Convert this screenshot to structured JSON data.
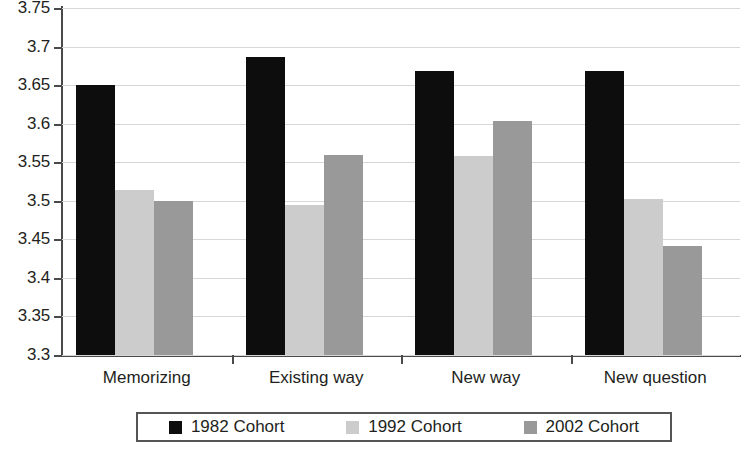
{
  "chart_data": {
    "type": "bar",
    "title": "",
    "subtitle": "",
    "xlabel": "",
    "ylabel": "",
    "ylim": [
      3.3,
      3.75
    ],
    "ytick_step": 0.05,
    "ytick_labels": [
      "3.75",
      "3.7",
      "3.65",
      "3.6",
      "3.55",
      "3.5",
      "3.45",
      "3.4",
      "3.35",
      "3.3"
    ],
    "ytick_values": [
      3.75,
      3.7,
      3.65,
      3.6,
      3.55,
      3.5,
      3.45,
      3.4,
      3.35,
      3.3
    ],
    "grid": true,
    "grid_axis": "y",
    "legend_position": "bottom",
    "categories": [
      "Memorizing",
      "Existing way",
      "New way",
      "New question"
    ],
    "series": [
      {
        "name": "1982 Cohort",
        "color": "#0d0d0d",
        "values": [
          3.65,
          3.686,
          3.668,
          3.668
        ]
      },
      {
        "name": "1992 Cohort",
        "color": "#cccccc",
        "values": [
          3.514,
          3.494,
          3.558,
          3.502
        ]
      },
      {
        "name": "2002 Cohort",
        "color": "#999999",
        "values": [
          3.5,
          3.56,
          3.604,
          3.441
        ]
      }
    ]
  },
  "legend": {
    "items": [
      {
        "label": "1982 Cohort",
        "swatch": "legend-swatch-1982"
      },
      {
        "label": "1992 Cohort",
        "swatch": "legend-swatch-1992"
      },
      {
        "label": "2002 Cohort",
        "swatch": "legend-swatch-2002"
      }
    ]
  }
}
